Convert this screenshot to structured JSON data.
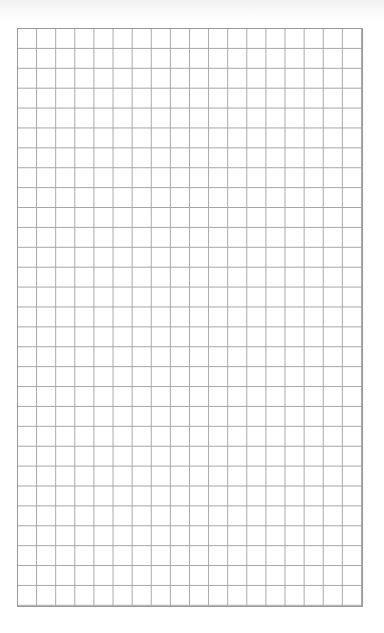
{
  "page": {
    "type": "graph-paper",
    "grid": {
      "columns": 18,
      "rows": 29,
      "line_color": "#a6a6a6",
      "border_color": "#9a9a9a",
      "background": "#ffffff"
    }
  }
}
